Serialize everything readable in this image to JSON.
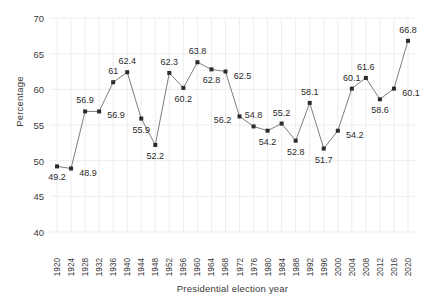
{
  "chart_data": {
    "type": "line",
    "title": "",
    "xlabel": "Presidential election year",
    "ylabel": "Percentage",
    "grid": true,
    "legend": false,
    "marker": "square-dot",
    "line_color": "#6e6e6e",
    "marker_color": "#2b2b2b",
    "grid_color": "#ededed",
    "ylim": [
      40,
      70
    ],
    "yticks": [
      40,
      45,
      50,
      55,
      60,
      65,
      70
    ],
    "categories": [
      "1920",
      "1924",
      "1928",
      "1932",
      "1936",
      "1940",
      "1944",
      "1948",
      "1952",
      "1956",
      "1960",
      "1964",
      "1968",
      "1972",
      "1976",
      "1980",
      "1984",
      "1988",
      "1992",
      "1996",
      "2000",
      "2004",
      "2008",
      "2012",
      "2016",
      "2020"
    ],
    "values": [
      49.2,
      48.9,
      56.9,
      56.9,
      61,
      62.4,
      55.9,
      52.2,
      62.3,
      60.2,
      63.8,
      62.8,
      62.5,
      56.2,
      54.8,
      54.2,
      55.2,
      52.8,
      58.1,
      51.7,
      54.2,
      60.1,
      61.6,
      58.6,
      60.1,
      66.8
    ],
    "point_labels": [
      "49.2",
      "48.9",
      "56.9",
      "56.9",
      "61",
      "62.4",
      "55.9",
      "52.2",
      "62.3",
      "60.2",
      "63.8",
      "62.8",
      "62.5",
      "56.2",
      "54.8",
      "54.2",
      "55.2",
      "52.8",
      "58.1",
      "51.7",
      "54.2",
      "60.1",
      "61.6",
      "58.6",
      "60.1",
      "66.8"
    ],
    "label_positions": [
      "below",
      "right",
      "above",
      "right",
      "above",
      "above",
      "below",
      "below",
      "above",
      "below",
      "above",
      "below",
      "right",
      "left",
      "above",
      "below",
      "above",
      "below",
      "above",
      "below",
      "right",
      "above",
      "above",
      "below",
      "right",
      "above"
    ]
  }
}
